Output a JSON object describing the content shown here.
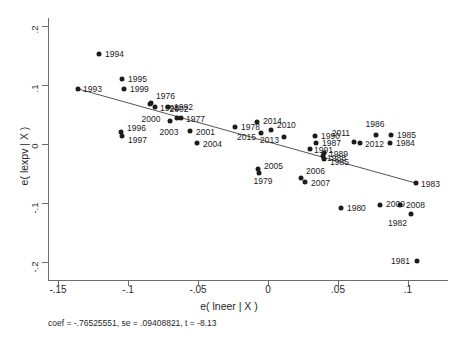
{
  "chart_data": {
    "type": "scatter",
    "title": "",
    "xlabel": "e( lneer | X )",
    "ylabel": "e( lexpv | X )",
    "xlim": [
      -0.165,
      0.121
    ],
    "ylim": [
      -0.215,
      0.218
    ],
    "xticks": [
      "-.15",
      "-.1",
      "-.05",
      "0",
      ".05",
      ".1"
    ],
    "xtick_values": [
      -0.15,
      -0.1,
      -0.05,
      0,
      0.05,
      0.1
    ],
    "yticks": [
      ".2",
      ".1",
      "0",
      "-.1",
      "-.2"
    ],
    "ytick_values": [
      0.2,
      0.1,
      0,
      -0.1,
      -0.2
    ],
    "grid": false,
    "legend": null,
    "marker_color": "#1c1c1c",
    "line_color": "#555555",
    "annotation": "coef = -.76525551, se = .09408821, t = -8.13",
    "fit_line": {
      "slope": -0.76525551,
      "se": 0.09408821,
      "t": -8.13,
      "x_start": -0.136,
      "y_start": 0.0935,
      "x_end": 0.106,
      "y_end": -0.0665
    },
    "points": [
      {
        "label": "1993",
        "x": -0.1357,
        "y": 0.094,
        "lx": "r",
        "dx": 5,
        "dy": 0
      },
      {
        "label": "1994",
        "x": -0.1207,
        "y": 0.1525,
        "lx": "r",
        "dx": 6,
        "dy": 0
      },
      {
        "label": "1995",
        "x": -0.1043,
        "y": 0.111,
        "lx": "r",
        "dx": 6,
        "dy": 0
      },
      {
        "label": "1999",
        "x": -0.1029,
        "y": 0.094,
        "lx": "r",
        "dx": 6,
        "dy": 0
      },
      {
        "label": "1996",
        "x": -0.105,
        "y": 0.0195,
        "lx": "r",
        "dx": 6,
        "dy": -4
      },
      {
        "label": "1997",
        "x": -0.1043,
        "y": 0.0135,
        "lx": "r",
        "dx": 6,
        "dy": 4
      },
      {
        "label": "1976",
        "x": -0.0836,
        "y": 0.0695,
        "lx": "r",
        "dx": 5,
        "dy": -7
      },
      {
        "label": "1998",
        "x": -0.0807,
        "y": 0.063,
        "lx": "r",
        "dx": 5,
        "dy": 1
      },
      {
        "label": "2000",
        "x": -0.0843,
        "y": 0.068,
        "lx": "c",
        "dx": 1,
        "dy": 15
      },
      {
        "label": "1992",
        "x": -0.0714,
        "y": 0.0625,
        "lx": "r",
        "dx": 6,
        "dy": 0
      },
      {
        "label": "2002",
        "x": -0.065,
        "y": 0.0445,
        "lx": "c",
        "dx": 2,
        "dy": -9
      },
      {
        "label": "1977",
        "x": -0.0621,
        "y": 0.0435,
        "lx": "r",
        "dx": 5,
        "dy": 1
      },
      {
        "label": "2003",
        "x": -0.07,
        "y": 0.039,
        "lx": "c",
        "dx": -1,
        "dy": 11
      },
      {
        "label": "2001",
        "x": -0.0557,
        "y": 0.0225,
        "lx": "r",
        "dx": 6,
        "dy": 1
      },
      {
        "label": "2004",
        "x": -0.0507,
        "y": 0.002,
        "lx": "r",
        "dx": 6,
        "dy": 1
      },
      {
        "label": "1978",
        "x": -0.0236,
        "y": 0.0295,
        "lx": "r",
        "dx": 6,
        "dy": 0
      },
      {
        "label": "2014",
        "x": -0.0079,
        "y": 0.037,
        "lx": "r",
        "dx": 6,
        "dy": -1
      },
      {
        "label": "2015",
        "x": -0.005,
        "y": 0.0185,
        "lx": "l",
        "dx": -5,
        "dy": 4
      },
      {
        "label": "2010",
        "x": 0.0021,
        "y": 0.0245,
        "lx": "r",
        "dx": 6,
        "dy": -5
      },
      {
        "label": "2013",
        "x": 0.0114,
        "y": 0.012,
        "lx": "l",
        "dx": -5,
        "dy": 3
      },
      {
        "label": "2005",
        "x": -0.0071,
        "y": -0.043,
        "lx": "r",
        "dx": 6,
        "dy": -3
      },
      {
        "label": "1979",
        "x": -0.0064,
        "y": -0.0485,
        "lx": "c",
        "dx": 4,
        "dy": 8
      },
      {
        "label": "2006",
        "x": 0.0236,
        "y": -0.057,
        "lx": "r",
        "dx": 5,
        "dy": -7
      },
      {
        "label": "2007",
        "x": 0.0264,
        "y": -0.065,
        "lx": "r",
        "dx": 6,
        "dy": 1
      },
      {
        "label": "1990",
        "x": 0.0336,
        "y": 0.0135,
        "lx": "r",
        "dx": 6,
        "dy": 0
      },
      {
        "label": "1987",
        "x": 0.0343,
        "y": 0.002,
        "lx": "r",
        "dx": 6,
        "dy": 0
      },
      {
        "label": "1991",
        "x": 0.03,
        "y": -0.009,
        "lx": "r",
        "dx": 4,
        "dy": 1
      },
      {
        "label": "1989",
        "x": 0.04,
        "y": -0.015,
        "lx": "r",
        "dx": 5,
        "dy": 1
      },
      {
        "label": "1988",
        "x": 0.0393,
        "y": -0.021,
        "lx": "r",
        "dx": 4,
        "dy": 2
      },
      {
        "label": "1985",
        "x": 0.04,
        "y": -0.025,
        "lx": "r",
        "dx": 6,
        "dy": 3
      },
      {
        "label": "2011",
        "x": 0.0614,
        "y": 0.003,
        "lx": "l",
        "dx": -4,
        "dy": -9
      },
      {
        "label": "2012",
        "x": 0.0657,
        "y": 0.001,
        "lx": "r",
        "dx": 5,
        "dy": 1
      },
      {
        "label": "1986",
        "x": 0.0771,
        "y": 0.015,
        "lx": "c",
        "dx": -1,
        "dy": -11
      },
      {
        "label": "1985",
        "x": 0.0879,
        "y": 0.0145,
        "lx": "r",
        "dx": 6,
        "dy": 0
      },
      {
        "label": "1984",
        "x": 0.0871,
        "y": 0.001,
        "lx": "r",
        "dx": 6,
        "dy": 0
      },
      {
        "label": "1983",
        "x": 0.1057,
        "y": -0.0665,
        "lx": "r",
        "dx": 5,
        "dy": 1
      },
      {
        "label": "1980",
        "x": 0.0521,
        "y": -0.109,
        "lx": "r",
        "dx": 6,
        "dy": 0
      },
      {
        "label": "2009",
        "x": 0.08,
        "y": -0.103,
        "lx": "r",
        "dx": 6,
        "dy": -1
      },
      {
        "label": "2008",
        "x": 0.0943,
        "y": -0.1035,
        "lx": "r",
        "dx": 6,
        "dy": 0
      },
      {
        "label": "1982",
        "x": 0.1021,
        "y": -0.1185,
        "lx": "l",
        "dx": -4,
        "dy": 9
      },
      {
        "label": "1981",
        "x": 0.1064,
        "y": -0.1985,
        "lx": "l",
        "dx": -7,
        "dy": 0
      }
    ]
  },
  "axis": {
    "x_title": "e( lneer | X )",
    "y_title": "e( lexpv | X )",
    "footnote": "coef = -.76525551, se = .09408821, t = -8.13"
  }
}
